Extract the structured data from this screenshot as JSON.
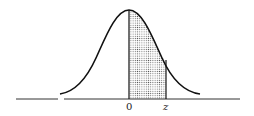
{
  "diagram": {
    "type": "standard-normal-curve",
    "labels": {
      "origin": "0",
      "z": "z"
    },
    "colors": {
      "curve": "#111111",
      "shading": "#555555",
      "background": "#ffffff"
    }
  }
}
